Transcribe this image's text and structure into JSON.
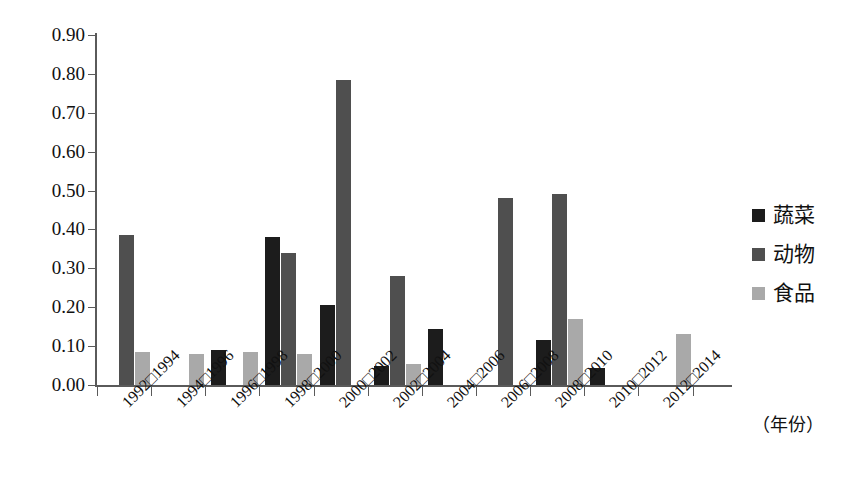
{
  "chart_data": {
    "type": "bar",
    "title": "",
    "xlabel": "（年份）",
    "ylabel": "",
    "ylim": [
      0.0,
      0.9
    ],
    "ytick_step": 0.1,
    "ytick_labels": [
      "0.00",
      "0.10",
      "0.20",
      "0.30",
      "0.40",
      "0.50",
      "0.60",
      "0.70",
      "0.80",
      "0.90"
    ],
    "grid": false,
    "legend_position": "right",
    "categories": [
      "1992□1994",
      "1994□1996",
      "1996□1998",
      "1998□2000",
      "2000□2002",
      "2002□2004",
      "2004□2006",
      "2006□2008",
      "2008□2010",
      "2010□2012",
      "2012□2014"
    ],
    "series": [
      {
        "name": "蔬菜",
        "color": "#1c1c1c",
        "values": [
          0.0,
          0.0,
          0.09,
          0.38,
          0.205,
          0.05,
          0.145,
          0.0,
          0.115,
          0.045,
          0.0
        ]
      },
      {
        "name": "动物",
        "color": "#4f4f4f",
        "values": [
          0.385,
          0.0,
          0.0,
          0.34,
          0.785,
          0.28,
          0.0,
          0.48,
          0.49,
          0.0,
          0.0
        ]
      },
      {
        "name": "食品",
        "color": "#a9a9a9",
        "values": [
          0.085,
          0.08,
          0.085,
          0.08,
          0.0,
          0.055,
          0.0,
          0.0,
          0.17,
          0.0,
          0.13
        ]
      }
    ]
  },
  "legend": {
    "items": [
      {
        "label": "蔬菜",
        "color": "#1c1c1c"
      },
      {
        "label": "动物",
        "color": "#4f4f4f"
      },
      {
        "label": "食品",
        "color": "#a9a9a9"
      }
    ]
  },
  "axis": {
    "x_title": "（年份）"
  }
}
